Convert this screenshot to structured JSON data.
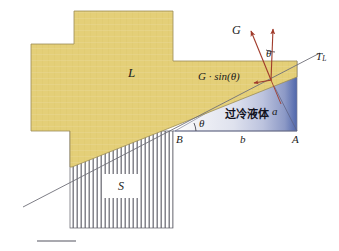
{
  "figure": {
    "width": 339,
    "height": 251,
    "background": "#ffffff"
  },
  "colors": {
    "liquid_gold": "#e4cf78",
    "gold_edge": "#9b8c55",
    "liquid_blue_dark": "#4a62a8",
    "liquid_blue_light": "#f2f3f6",
    "arrow_red": "#a03a2a",
    "line_gray": "#6f6f78",
    "hatch_gray": "#5d5d66",
    "text": "#1b1b1b",
    "scale_bar": "#8d8d95"
  },
  "regions": {
    "molten_region": {
      "name": "L",
      "label": "L",
      "description": "gold cross-shaped molten / liquid region"
    },
    "solid_region": {
      "name": "S",
      "label": "S",
      "description": "vertically hatched solid region"
    },
    "supercooled_region": {
      "label": "过冷液体",
      "description": "blue gradient wedge, supercooled liquid"
    }
  },
  "labels": {
    "L": "L",
    "S": "S",
    "G": "G",
    "G_component": "G · sin(θ)",
    "theta_top": "θ",
    "theta_wedge": "θ",
    "alpha": "a",
    "point_B": "B",
    "point_A": "A",
    "segment_b": "b",
    "T_L_base": "T",
    "T_L_sub": "L",
    "supercooled": "过冷液体"
  },
  "vectors": {
    "gravity_vector": {
      "label": "G",
      "description": "slanted red arrow pointing up-left from interface point"
    },
    "vertical_vector": {
      "label": "",
      "description": "vertical red arrow pointing up from interface point"
    },
    "component_vector": {
      "label": "G · sin(θ)",
      "description": "short red arrow pointing left along the inclined interface"
    }
  },
  "axes": {
    "liquidus_line": {
      "label": "T_L",
      "description": "thin gray straight line crossing the figure, liquidus isotherm"
    }
  },
  "scale_bar": {
    "present": true,
    "label": ""
  }
}
